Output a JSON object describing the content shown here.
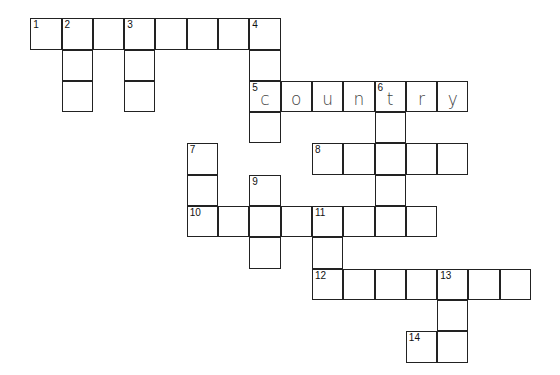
{
  "puzzle": {
    "origin": {
      "x": 31,
      "y": 19
    },
    "cell_size": 31.3,
    "cells": [
      {
        "r": 0,
        "c": 0,
        "num": "1"
      },
      {
        "r": 0,
        "c": 1,
        "num": "2"
      },
      {
        "r": 0,
        "c": 2
      },
      {
        "r": 0,
        "c": 3,
        "num": "3"
      },
      {
        "r": 0,
        "c": 4
      },
      {
        "r": 0,
        "c": 5
      },
      {
        "r": 0,
        "c": 6
      },
      {
        "r": 0,
        "c": 7,
        "num": "4"
      },
      {
        "r": 1,
        "c": 1
      },
      {
        "r": 1,
        "c": 3
      },
      {
        "r": 1,
        "c": 7
      },
      {
        "r": 2,
        "c": 1
      },
      {
        "r": 2,
        "c": 3
      },
      {
        "r": 2,
        "c": 7,
        "num": "5",
        "letter": "c"
      },
      {
        "r": 2,
        "c": 8,
        "letter": "o"
      },
      {
        "r": 2,
        "c": 9,
        "letter": "u"
      },
      {
        "r": 2,
        "c": 10,
        "letter": "n"
      },
      {
        "r": 2,
        "c": 11,
        "num": "6",
        "letter": "t"
      },
      {
        "r": 2,
        "c": 12,
        "letter": "r"
      },
      {
        "r": 2,
        "c": 13,
        "letter": "y"
      },
      {
        "r": 3,
        "c": 7
      },
      {
        "r": 3,
        "c": 11
      },
      {
        "r": 4,
        "c": 5,
        "num": "7"
      },
      {
        "r": 4,
        "c": 9,
        "num": "8"
      },
      {
        "r": 4,
        "c": 10
      },
      {
        "r": 4,
        "c": 11
      },
      {
        "r": 4,
        "c": 12
      },
      {
        "r": 4,
        "c": 13
      },
      {
        "r": 5,
        "c": 5
      },
      {
        "r": 5,
        "c": 7,
        "num": "9"
      },
      {
        "r": 5,
        "c": 11
      },
      {
        "r": 6,
        "c": 5,
        "num": "10"
      },
      {
        "r": 6,
        "c": 6
      },
      {
        "r": 6,
        "c": 7
      },
      {
        "r": 6,
        "c": 8
      },
      {
        "r": 6,
        "c": 9,
        "num": "11"
      },
      {
        "r": 6,
        "c": 10
      },
      {
        "r": 6,
        "c": 11
      },
      {
        "r": 6,
        "c": 12
      },
      {
        "r": 7,
        "c": 7
      },
      {
        "r": 7,
        "c": 9
      },
      {
        "r": 8,
        "c": 9,
        "num": "12"
      },
      {
        "r": 8,
        "c": 10
      },
      {
        "r": 8,
        "c": 11
      },
      {
        "r": 8,
        "c": 12
      },
      {
        "r": 8,
        "c": 13,
        "num": "13"
      },
      {
        "r": 8,
        "c": 14
      },
      {
        "r": 8,
        "c": 15
      },
      {
        "r": 9,
        "c": 13
      },
      {
        "r": 10,
        "c": 12,
        "num": "14"
      },
      {
        "r": 10,
        "c": 13
      }
    ],
    "filled_words": [
      {
        "number": "5",
        "direction": "across",
        "answer": "country"
      }
    ]
  }
}
